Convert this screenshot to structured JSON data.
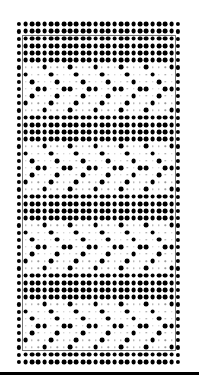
{
  "pattern_chart": {
    "description": "Dot grid pattern chart (knitting/weaving style): 48 rows x 26 columns; X = large filled dot, o = edge dot, . = small grey dot",
    "columns": 26,
    "rows_count": 48,
    "grid": {
      "origin_x": 19.3,
      "origin_y": 24.3,
      "col_spacing": 6.35,
      "row_spacing": 7.18
    },
    "colors": {
      "dot": "#000000",
      "small_dot": "#9a9a9a",
      "frame": "#777777",
      "baseline": "#000000",
      "background": "#ffffff"
    },
    "bands": [
      {
        "name": "solid",
        "rows": "0-5"
      },
      {
        "name": "diamond-motif",
        "rows": "6-12"
      },
      {
        "name": "solid",
        "rows": "13-16"
      },
      {
        "name": "diamond-motif",
        "rows": "17-23"
      },
      {
        "name": "solid",
        "rows": "24-27"
      },
      {
        "name": "diamond-motif",
        "rows": "28-34"
      },
      {
        "name": "solid",
        "rows": "35-38"
      },
      {
        "name": "diamond-motif",
        "rows": "39-45"
      },
      {
        "name": "solid",
        "rows": "46-47"
      }
    ],
    "rows": [
      "oXXXXXXXXXXXXXXXXXXXXXXXXo",
      "oXXXXXXXXXXXXXXXXXXXXXXXXo",
      "oXXXXXXXXXXXXXXXXXXXXXXXXo",
      "oXXXXXXXXXXXXXXXXXXXXXXXXo",
      "oXXXXXXXXXXXXXXXXXXXXXXXXo",
      "oXXXXXXXXXXXXXXXXXXXXXXXXo",
      "o...X...X...X...X...X...Xo",
      "oX...X...X...X...X...X...o",
      "o.X...X...X...X...X...X..o",
      "o..XX..XX..XX..XX..XX..XXo",
      "o.X...X...X...X...X...X..o",
      "oX...X...X...X...X...X...o",
      "o...X...X...X...X...X...Xo",
      "oXXXXXXXXXXXXXXXXXXXXXXXXo",
      "oXXXXXXXXXXXXXXXXXXXXXXXXo",
      "oXXXXXXXXXXXXXXXXXXXXXXXXo",
      "oXXXXXXXXXXXXXXXXXXXXXXXXo",
      "o...X...X...X...X...X...Xo",
      "oX...X...X...X...X...X...o",
      "o.X...X...X...X...X...X..o",
      "o..XX..XX..XX..XX..XX..XXo",
      "o.X...X...X...X...X...X..o",
      "oX...X...X...X...X...X...o",
      "o...X...X...X...X...X...Xo",
      "oXXXXXXXXXXXXXXXXXXXXXXXXo",
      "oXXXXXXXXXXXXXXXXXXXXXXXXo",
      "oXXXXXXXXXXXXXXXXXXXXXXXXo",
      "oXXXXXXXXXXXXXXXXXXXXXXXXo",
      "o...X...X...X...X...X...Xo",
      "oX...X...X...X...X...X...o",
      "o.X...X...X...X...X...X..o",
      "o..XX..XX..XX..XX..XX..XXo",
      "o.X...X...X...X...X...X..o",
      "oX...X...X...X...X...X...o",
      "o...X...X...X...X...X...Xo",
      "oXXXXXXXXXXXXXXXXXXXXXXXXo",
      "oXXXXXXXXXXXXXXXXXXXXXXXXo",
      "oXXXXXXXXXXXXXXXXXXXXXXXXo",
      "oXXXXXXXXXXXXXXXXXXXXXXXXo",
      "o...X...X...X...X...X...Xo",
      "oX...X...X...X...X...X...o",
      "o.X...X...X...X...X...X..o",
      "o..XX..XX..XX..XX..XX..XXo",
      "o.X...X...X...X...X...X..o",
      "oX...X...X...X...X...X...o",
      "o...X...X...X...X...X...Xo",
      "oXXXXXXXXXXXXXXXXXXXXXXXXo",
      "oXXXXXXXXXXXXXXXXXXXXXXXXo"
    ]
  }
}
